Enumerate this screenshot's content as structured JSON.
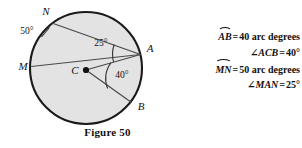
{
  "figure": {
    "caption": "Figure 50",
    "fill_color": "#e3e3e3",
    "stroke_color": "#1a1a1a",
    "points": {
      "N": "N",
      "M": "M",
      "A": "A",
      "B": "B",
      "C": "C"
    },
    "angle_marks": {
      "exterior_arc_MN": "50°",
      "inscribed_at_A": "25°",
      "central_at_C": "40°"
    }
  },
  "statements": [
    {
      "id": "arc-AB",
      "subject_type": "arc",
      "subject": "AB",
      "relation": "=",
      "value": "40 arc degrees"
    },
    {
      "id": "angle-ACB",
      "subject_type": "angle",
      "angle_symbol": "∠",
      "subject": "ACB",
      "relation": "=",
      "value": "40°"
    },
    {
      "id": "arc-MN",
      "subject_type": "arc",
      "subject": "MN",
      "relation": "=",
      "value": "50 arc degrees"
    },
    {
      "id": "angle-MAN",
      "subject_type": "angle",
      "angle_symbol": "∠",
      "subject": "MAN",
      "relation": "=",
      "value": "25°"
    }
  ]
}
